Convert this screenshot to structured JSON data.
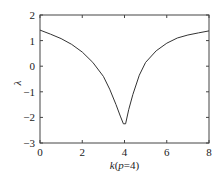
{
  "chart_data": {
    "type": "line",
    "title": "",
    "xlabel": "k(p=4)",
    "xlabel_parts": [
      {
        "text": "k",
        "italic": true
      },
      {
        "text": "(",
        "italic": false
      },
      {
        "text": "p",
        "italic": true
      },
      {
        "text": "=4)",
        "italic": false
      }
    ],
    "ylabel": "λ",
    "xlim": [
      0,
      8
    ],
    "ylim": [
      -3,
      2
    ],
    "xticks": [
      0,
      2,
      4,
      6,
      8
    ],
    "yticks": [
      2,
      1,
      0,
      -1,
      -2,
      -3
    ],
    "grid": false,
    "legend": null,
    "series": [
      {
        "name": "lambda",
        "color": "#333333",
        "x": [
          0,
          0.5,
          1.0,
          1.5,
          2.0,
          2.5,
          3.0,
          3.3,
          3.6,
          3.8,
          3.95,
          4.05,
          4.2,
          4.4,
          4.7,
          5.0,
          5.5,
          6.0,
          6.5,
          7.0,
          7.5,
          8.0
        ],
        "y": [
          1.41,
          1.25,
          1.08,
          0.85,
          0.55,
          0.15,
          -0.4,
          -0.9,
          -1.5,
          -1.95,
          -2.25,
          -2.25,
          -1.7,
          -1.1,
          -0.35,
          0.15,
          0.6,
          0.9,
          1.1,
          1.22,
          1.3,
          1.38
        ]
      }
    ]
  }
}
